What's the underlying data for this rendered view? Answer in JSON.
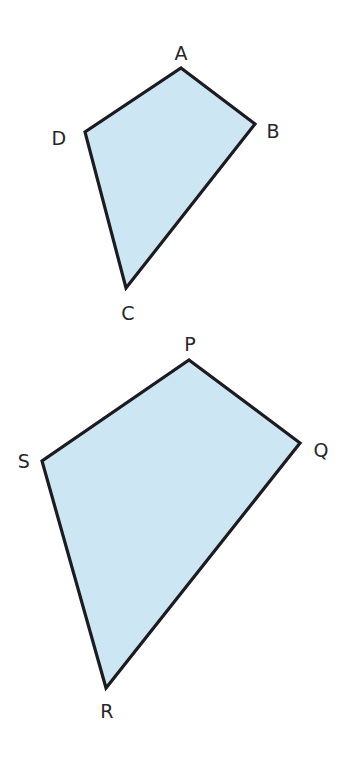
{
  "figure": {
    "background_color": "#ffffff",
    "stroke_color": "#1c1c20",
    "stroke_width": 3.2,
    "fill_color": "#cde6f3",
    "label_color": "#26262b",
    "shapes": [
      {
        "name": "quadrilateral-abcd",
        "vertex_order": "A,B,C,D",
        "points": "181,68 255,124 126,288 85,132",
        "labels": [
          {
            "text": "A",
            "x": 181,
            "y": 53
          },
          {
            "text": "B",
            "x": 273,
            "y": 131
          },
          {
            "text": "C",
            "x": 128,
            "y": 313
          },
          {
            "text": "D",
            "x": 59,
            "y": 138
          }
        ]
      },
      {
        "name": "quadrilateral-pqrs",
        "vertex_order": "P,Q,R,S",
        "points": "189,360 300,443 106,688 42,461",
        "labels": [
          {
            "text": "P",
            "x": 190,
            "y": 344
          },
          {
            "text": "Q",
            "x": 321,
            "y": 450
          },
          {
            "text": "R",
            "x": 107,
            "y": 711
          },
          {
            "text": "S",
            "x": 24,
            "y": 461
          }
        ]
      }
    ]
  }
}
